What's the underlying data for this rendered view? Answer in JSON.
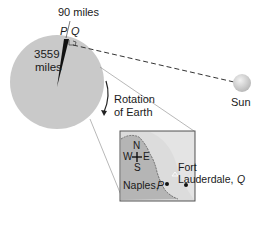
{
  "diagram": {
    "distance_label": "90 miles",
    "point_p": "P",
    "point_q": "Q",
    "radius_label_line1": "3559",
    "radius_label_line2": "miles",
    "rotation_label_line1": "Rotation",
    "rotation_label_line2": "of Earth",
    "sun_label": "Sun",
    "inset": {
      "compass": {
        "n": "N",
        "s": "S",
        "e": "E",
        "w": "W"
      },
      "fort_label_line1": "Fort",
      "fort_label_line2": "Lauderdale,",
      "fort_point": "Q",
      "naples_label": "Naples,",
      "naples_point": "P"
    }
  },
  "colors": {
    "earth": "#c9c9c9",
    "sun": "#d4d4d4",
    "inset_land": "#b8b8b8",
    "inset_sea": "#dcdcdc",
    "line": "#1a1a1a"
  }
}
